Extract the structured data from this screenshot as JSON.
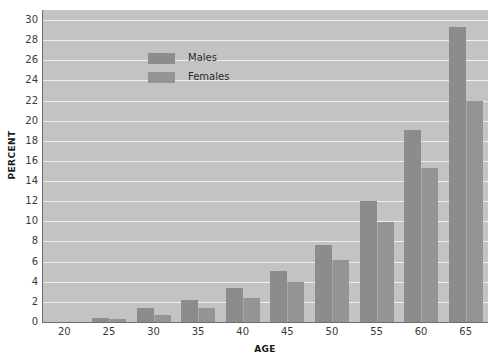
{
  "chart_data": {
    "type": "bar",
    "title": "",
    "xlabel": "AGE",
    "ylabel": "PERCENT",
    "categories": [
      "20",
      "25",
      "30",
      "35",
      "40",
      "45",
      "50",
      "55",
      "60",
      "65"
    ],
    "series": [
      {
        "name": "Males",
        "color": "#8c8c8c",
        "values": [
          0,
          0.4,
          1.35,
          2.2,
          3.4,
          5.1,
          7.7,
          12.0,
          19.1,
          29.3
        ]
      },
      {
        "name": "Females",
        "color": "#949494",
        "values": [
          0,
          0.25,
          0.65,
          1.35,
          2.35,
          4.0,
          6.2,
          9.9,
          15.3,
          22.0
        ]
      }
    ],
    "ylim": [
      0,
      31
    ],
    "yticks": [
      0,
      2,
      4,
      6,
      8,
      10,
      12,
      14,
      16,
      18,
      20,
      22,
      24,
      26,
      28,
      30
    ],
    "ytick_labels": [
      "0",
      "2",
      "4",
      "6",
      "8",
      "10",
      "12",
      "14",
      "16",
      "18",
      "20",
      "22",
      "24",
      "26",
      "28",
      "30"
    ],
    "xtick_labels": [
      "20",
      "25",
      "30",
      "35",
      "40",
      "45",
      "50",
      "55",
      "60",
      "65"
    ],
    "grid": true,
    "grid_color": "#efefef",
    "plot_background": "#c3c3c3",
    "legend_position": "upper left",
    "legend": [
      {
        "label": "Males",
        "color": "#8c8c8c"
      },
      {
        "label": "Females",
        "color": "#949494"
      }
    ]
  }
}
